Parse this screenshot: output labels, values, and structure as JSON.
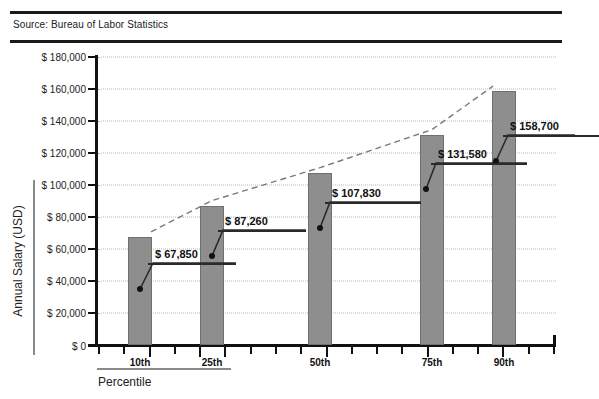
{
  "source": {
    "label": "Source: Bureau of Labor Statistics"
  },
  "axis_titles": {
    "y": "Annual Salary (USD)",
    "x": "Percentile"
  },
  "chart_data": {
    "type": "bar",
    "title": "",
    "subtitle": "",
    "xlabel": "Percentile",
    "ylabel": "Annual Salary (USD)",
    "categories": [
      "10th",
      "25th",
      "50th",
      "75th",
      "90th"
    ],
    "values": [
      67850,
      87260,
      107830,
      131580,
      158700
    ],
    "data_labels": [
      "$ 67,850",
      "$ 87,260",
      "$ 107,830",
      "$ 131,580",
      "$ 158,700"
    ],
    "ylim": [
      0,
      180000
    ],
    "ytick_values": [
      0,
      20000,
      40000,
      60000,
      80000,
      100000,
      120000,
      140000,
      160000,
      180000
    ],
    "ytick_labels": [
      "$ 0",
      "$ 20,000",
      "$ 40,000",
      "$ 60,000",
      "$ 80,000",
      "$ 100,000",
      "$ 120,000",
      "$ 140,000",
      "$ 160,000",
      "$ 180,000"
    ],
    "grid": true,
    "grid_style": "dotted",
    "legend": "none",
    "bar_color": "#8e8e8e",
    "trend_line": {
      "style": "dashed",
      "color": "#7a7a7a",
      "points": [
        {
          "category": "10th",
          "value": 67850
        },
        {
          "category": "25th",
          "value": 87260
        },
        {
          "category": "50th",
          "value": 107830
        },
        {
          "category": "75th",
          "value": 131580
        },
        {
          "category": "90th",
          "value": 158700
        }
      ]
    }
  }
}
